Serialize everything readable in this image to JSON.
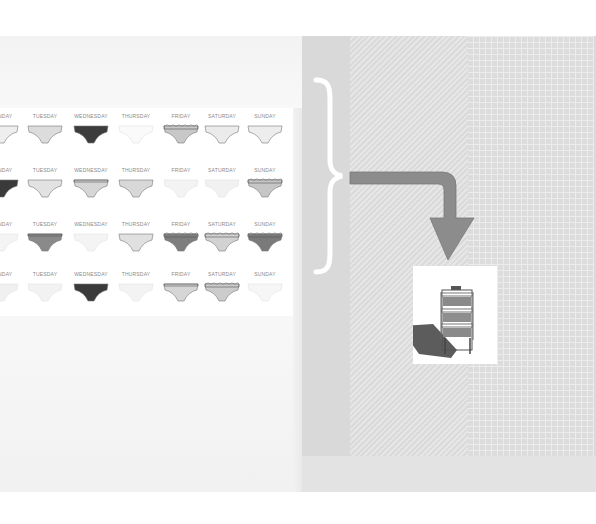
{
  "left_panel": {
    "grid": {
      "rows": [
        {
          "days": [
            {
              "label": "MONDAY",
              "visible_label": "DAY",
              "color": "#eeeeee",
              "style": "plain"
            },
            {
              "label": "TUESDAY",
              "color": "#dcdcdc",
              "style": "plain"
            },
            {
              "label": "WEDNESDAY",
              "color": "#3c3c3c",
              "style": "plain"
            },
            {
              "label": "THURSDAY",
              "color": "#fafafa",
              "style": "plain"
            },
            {
              "label": "FRIDAY",
              "color": "#c8c8c8",
              "style": "lace"
            },
            {
              "label": "SATURDAY",
              "color": "#ebebeb",
              "style": "plain"
            },
            {
              "label": "SUNDAY",
              "color": "#ededed",
              "style": "plain"
            }
          ]
        },
        {
          "days": [
            {
              "label": "MONDAY",
              "visible_label": "DAY",
              "color": "#3a3a3a",
              "style": "plain"
            },
            {
              "label": "TUESDAY",
              "color": "#e2e2e2",
              "style": "plain"
            },
            {
              "label": "WEDNESDAY",
              "color": "#d6d6d6",
              "style": "banded"
            },
            {
              "label": "THURSDAY",
              "color": "#d8d8d8",
              "style": "plain"
            },
            {
              "label": "FRIDAY",
              "color": "#f3f3f3",
              "style": "plain"
            },
            {
              "label": "SATURDAY",
              "color": "#f1f1f1",
              "style": "plain"
            },
            {
              "label": "SUNDAY",
              "color": "#c6c6c6",
              "style": "lace"
            }
          ]
        },
        {
          "days": [
            {
              "label": "MONDAY",
              "visible_label": "DAY",
              "color": "#f4f4f4",
              "style": "plain"
            },
            {
              "label": "TUESDAY",
              "color": "#8a8a8a",
              "style": "banded"
            },
            {
              "label": "WEDNESDAY",
              "color": "#f4f4f4",
              "style": "plain"
            },
            {
              "label": "THURSDAY",
              "color": "#e0e0e0",
              "style": "plain"
            },
            {
              "label": "FRIDAY",
              "color": "#7e7e7e",
              "style": "lace"
            },
            {
              "label": "SATURDAY",
              "color": "#d2d2d2",
              "style": "lace"
            },
            {
              "label": "SUNDAY",
              "color": "#7a7a7a",
              "style": "lace"
            }
          ]
        },
        {
          "days": [
            {
              "label": "MONDAY",
              "visible_label": "DAY",
              "color": "#f0f0f0",
              "style": "plain"
            },
            {
              "label": "TUESDAY",
              "color": "#f2f2f2",
              "style": "plain"
            },
            {
              "label": "WEDNESDAY",
              "color": "#3a3a3a",
              "style": "plain"
            },
            {
              "label": "THURSDAY",
              "color": "#f3f3f3",
              "style": "plain"
            },
            {
              "label": "FRIDAY",
              "color": "#d6d6d6",
              "style": "banded"
            },
            {
              "label": "SATURDAY",
              "color": "#cccccc",
              "style": "lace"
            },
            {
              "label": "SUNDAY",
              "color": "#f6f6f6",
              "style": "plain"
            }
          ]
        }
      ]
    }
  },
  "right_panel": {
    "brace_color": "#ffffff",
    "arrow_color": "#8c8c8c",
    "rack": {
      "item": "drying rack with three shelves",
      "shadow_color": "#4a4a4a"
    }
  },
  "colors": {
    "panel_gray": "#d9d9d9",
    "background": "#ffffff",
    "label_gray": "#8a8a8a"
  }
}
